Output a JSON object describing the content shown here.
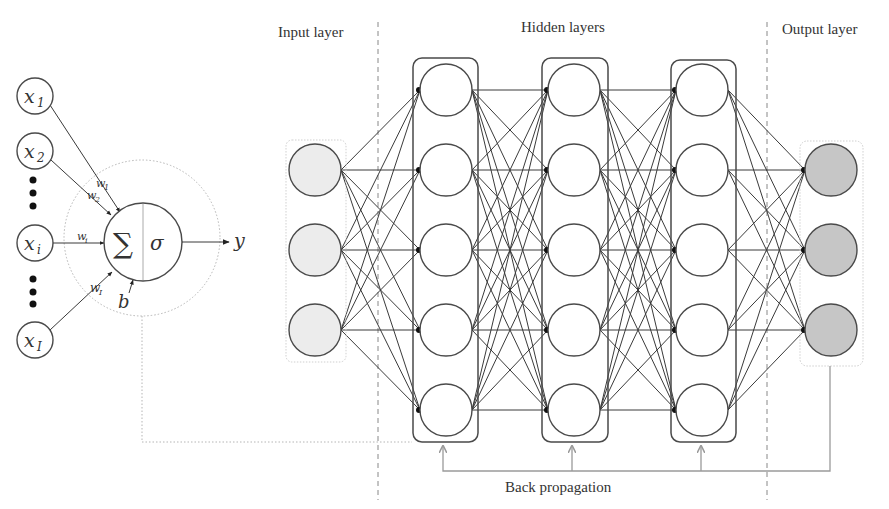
{
  "diagram": {
    "layer_labels": {
      "input": "Input layer",
      "hidden": "Hidden layers",
      "output": "Output layer"
    },
    "backprop_label": "Back propagation",
    "perceptron": {
      "inputs": [
        {
          "symbol": "x",
          "subscript": "1"
        },
        {
          "symbol": "x",
          "subscript": "2"
        },
        {
          "symbol": "x",
          "subscript": "i"
        },
        {
          "symbol": "x",
          "subscript": "I"
        }
      ],
      "weights": [
        {
          "symbol": "w",
          "subscript": "1"
        },
        {
          "symbol": "w",
          "subscript": "2"
        },
        {
          "symbol": "w",
          "subscript": "i"
        },
        {
          "symbol": "w",
          "subscript": "I"
        }
      ],
      "sum_symbol": "∑",
      "activation_symbol": "σ",
      "bias_symbol": "b",
      "output_symbol": "y",
      "ellipsis": "⋮"
    },
    "network": {
      "input_nodes": 3,
      "hidden_layers": 3,
      "hidden_nodes_per_layer": 5,
      "output_nodes": 3
    },
    "colors": {
      "line": "#3a3a3a",
      "input_fill": "#ececec",
      "output_fill": "#c6c6c6",
      "backprop": "#9a9a9a",
      "divider": "#888888"
    }
  }
}
